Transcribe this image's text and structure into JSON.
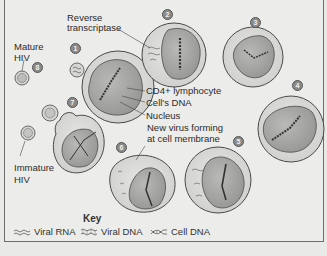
{
  "diagram": {
    "labels": {
      "reverse_transcriptase_1": "Reverse",
      "reverse_transcriptase_2": "transcriptase",
      "mature_hiv_1": "Mature",
      "mature_hiv_2": "HIV",
      "cd4": "CD4+ lymphocyte",
      "cells_dna": "Cell's DNA",
      "nucleus": "Nucleus",
      "new_virus_1": "New virus forming",
      "new_virus_2": "at cell membrane",
      "immature_hiv_1": "Immature",
      "immature_hiv_2": "HIV"
    },
    "steps": [
      "1",
      "2",
      "3",
      "4",
      "5",
      "6",
      "7",
      "8"
    ]
  },
  "key": {
    "title": "Key",
    "items": [
      {
        "label": "Viral RNA",
        "icon": "viral-rna-icon"
      },
      {
        "label": "Viral DNA",
        "icon": "viral-dna-icon"
      },
      {
        "label": "Cell DNA",
        "icon": "cell-dna-icon"
      }
    ]
  },
  "colors": {
    "background": "#ececea",
    "cell_fill": "#dcdcda",
    "nucleus_fill": "#a9a9a7",
    "outline": "#4a4a4a"
  }
}
